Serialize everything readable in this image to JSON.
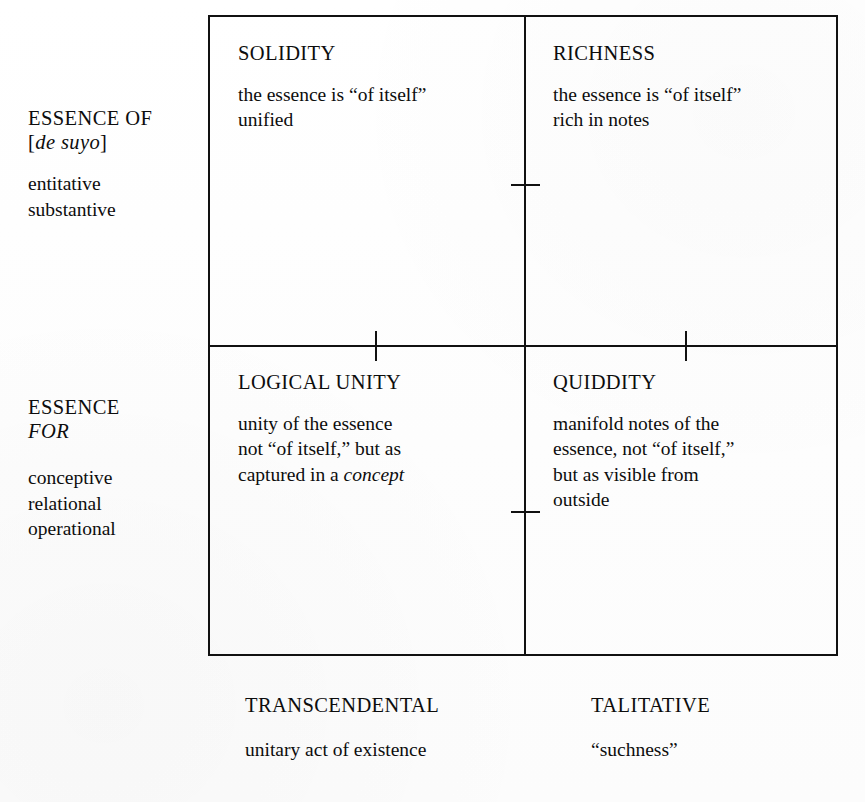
{
  "diagram": {
    "type": "2x2-matrix",
    "rows": [
      {
        "id": "essence-of",
        "head_line1": "ESSENCE OF",
        "head_line2_open": "[",
        "head_line2_italic": "de suyo",
        "head_line2_close": "]",
        "sub_line1": "entitative",
        "sub_line2": "substantive"
      },
      {
        "id": "essence-for",
        "head_line1": "ESSENCE",
        "head_line2_italic": "FOR",
        "sub_line1": "conceptive",
        "sub_line2": "relational",
        "sub_line3": "operational"
      }
    ],
    "columns": [
      {
        "id": "transcendental",
        "head": "TRANSCENDENTAL",
        "sub": "unitary act of existence"
      },
      {
        "id": "talitative",
        "head": "TALITATIVE",
        "sub": "“suchness”"
      }
    ],
    "cells": [
      {
        "id": "solidity",
        "position": "top-left",
        "title": "SOLIDITY",
        "line1": "the essence is “of itself”",
        "line2": "unified"
      },
      {
        "id": "richness",
        "position": "top-right",
        "title": "RICHNESS",
        "line1": "the essence is “of itself”",
        "line2": "rich in notes"
      },
      {
        "id": "logical-unity",
        "position": "bottom-left",
        "title": "LOGICAL UNITY",
        "line1": "unity of the essence",
        "line2": "not “of itself,” but as",
        "line3_prefix": "captured in a ",
        "line3_italic": "concept"
      },
      {
        "id": "quiddity",
        "position": "bottom-right",
        "title": "QUIDDITY",
        "line1": "manifold notes of the",
        "line2": "essence, not “of itself,”",
        "line3": "but as visible from",
        "line4": "outside"
      }
    ],
    "colors": {
      "ink": "#111111",
      "paper": "#ffffff"
    }
  }
}
